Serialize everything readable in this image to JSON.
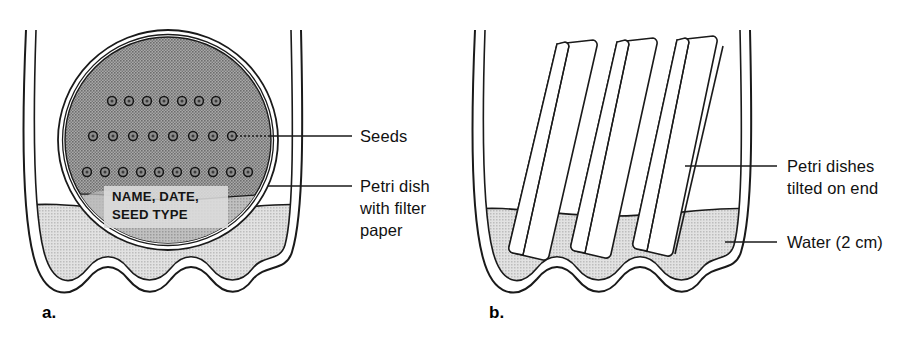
{
  "figure": {
    "type": "scientific-diagram",
    "background_color": "#ffffff",
    "ink_color": "#1a1a1a"
  },
  "colors": {
    "dish_fill": "#9a9a9a",
    "dish_fill_light": "#b4b4b4",
    "water_fill": "#cfcfcf",
    "water_fill_dark": "#c2c2c2",
    "glass_fill": "#ffffff",
    "label_text": "#111111"
  },
  "panels": [
    {
      "id": "a",
      "letter": "a.",
      "description": "Petri dish with filter paper and seeds resting flat inside a beaker of water",
      "dish_caption_lines": [
        "NAME, DATE,",
        "SEED TYPE"
      ],
      "seed_rows": [
        {
          "row": 1,
          "count": 7,
          "y": 101,
          "x_start": 112,
          "x_end": 216
        },
        {
          "row": 2,
          "count": 8,
          "y": 136,
          "x_start": 93,
          "x_end": 232
        },
        {
          "row": 3,
          "count": 10,
          "y": 172,
          "x_start": 87,
          "x_end": 248
        }
      ],
      "total_seeds": 25,
      "labels": [
        {
          "id": "seeds",
          "lines": [
            "Seeds"
          ],
          "leader_from_x": 232,
          "leader_from_y": 136,
          "leader_to_x": 323,
          "leader_to_y": 136
        },
        {
          "id": "petri-dish-with-filter-paper",
          "lines": [
            "Petri dish",
            "with filter",
            "paper"
          ],
          "leader_from_x": 268,
          "leader_from_y": 186,
          "leader_to_x": 323,
          "leader_to_y": 186
        }
      ]
    },
    {
      "id": "b",
      "letter": "b.",
      "description": "Three petri dishes tilted on end standing in 2 cm of water in a beaker",
      "dish_count": 3,
      "labels": [
        {
          "id": "petri-dishes-tilted-on-end",
          "lines": [
            "Petri dishes",
            "tilted on end"
          ],
          "leader_from_x": 228,
          "leader_from_y": 166,
          "leader_to_x": 292,
          "leader_to_y": 166
        },
        {
          "id": "water-2-cm",
          "lines": [
            "Water (2 cm)"
          ],
          "leader_from_x": 262,
          "leader_from_y": 242,
          "leader_to_x": 292,
          "leader_to_y": 242
        }
      ]
    }
  ],
  "all_text": [
    "Seeds",
    "Petri dish",
    "with filter",
    "paper",
    "NAME, DATE,",
    "SEED TYPE",
    "a.",
    "Petri dishes",
    "tilted on end",
    "Water (2 cm)",
    "b."
  ]
}
